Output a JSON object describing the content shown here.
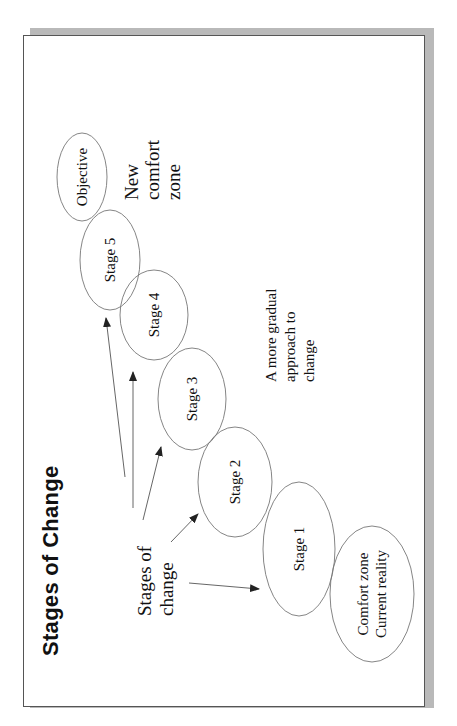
{
  "slide": {
    "title": "Stages of Change",
    "orientation": "rotated-90-ccw",
    "colors": {
      "border": "#555555",
      "shadow": "#b9b9b9",
      "ellipse_stroke": "#777777",
      "arrow": "#222222",
      "text": "#111111"
    }
  },
  "nodes": [
    {
      "id": "comfort",
      "lines": [
        "Comfort zone",
        "Current reality"
      ]
    },
    {
      "id": "stage1",
      "lines": [
        "Stage 1"
      ]
    },
    {
      "id": "stage2",
      "lines": [
        "Stage 2"
      ]
    },
    {
      "id": "stage3",
      "lines": [
        "Stage 3"
      ]
    },
    {
      "id": "stage4",
      "lines": [
        "Stage 4"
      ]
    },
    {
      "id": "stage5",
      "lines": [
        "Stage 5"
      ]
    },
    {
      "id": "objective",
      "lines": [
        "Objective"
      ]
    }
  ],
  "labels": {
    "stages_of_change": [
      "Stages of",
      "change"
    ],
    "gradual": [
      "A more gradual",
      "approach to",
      "change"
    ],
    "new_comfort": [
      "New",
      "comfort",
      "zone"
    ]
  },
  "edges": [
    {
      "from": "stages_of_change",
      "to": "stage1"
    },
    {
      "from": "stages_of_change",
      "to": "stage2"
    },
    {
      "from": "stages_of_change",
      "to": "stage3"
    },
    {
      "from": "stages_of_change",
      "to": "stage4"
    },
    {
      "from": "stages_of_change",
      "to": "stage5"
    }
  ]
}
